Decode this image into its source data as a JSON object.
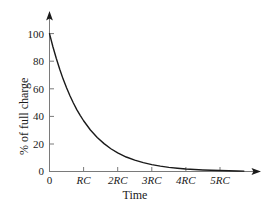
{
  "chart_data": {
    "type": "line",
    "title": "",
    "subtitle": "",
    "xlabel": "Time",
    "ylabel": "% of full charge",
    "grid": false,
    "legend": null,
    "xlim": [
      0,
      6
    ],
    "ylim": [
      0,
      105
    ],
    "xticks": [
      0,
      1,
      2,
      3,
      4,
      5
    ],
    "xtick_labels": [
      "0",
      "RC",
      "2RC",
      "3RC",
      "4RC",
      "5RC"
    ],
    "yticks": [
      0,
      20,
      40,
      60,
      80,
      100
    ],
    "ytick_labels": [
      "0",
      "20",
      "40",
      "60",
      "80",
      "100"
    ],
    "axis_arrows": {
      "x": true,
      "y": true
    },
    "curve_color": "#1a1a1a",
    "axis_color": "#6b6b6b",
    "background_color": "#ffffff",
    "annotations": [],
    "series": [
      {
        "name": "% of full charge",
        "formula": "100 * exp(-t/RC)",
        "x": [
          0,
          0.1,
          0.2,
          0.3,
          0.4,
          0.5,
          0.6,
          0.7,
          0.8,
          0.9,
          1.0,
          1.2,
          1.4,
          1.6,
          1.8,
          2.0,
          2.25,
          2.5,
          2.75,
          3.0,
          3.25,
          3.5,
          3.75,
          4.0,
          4.25,
          4.5,
          4.75,
          5.0,
          5.25,
          5.5,
          5.7
        ],
        "values": [
          100,
          90.5,
          81.9,
          74.1,
          67.0,
          60.7,
          54.9,
          49.7,
          44.9,
          40.7,
          36.8,
          30.1,
          24.7,
          20.2,
          16.5,
          13.5,
          10.5,
          8.2,
          6.4,
          5.0,
          3.9,
          3.0,
          2.4,
          1.8,
          1.4,
          1.1,
          0.9,
          0.7,
          0.5,
          0.4,
          0.3
        ]
      }
    ]
  },
  "labels": {
    "ytick_0": "0",
    "ytick_20": "20",
    "ytick_40": "40",
    "ytick_60": "60",
    "ytick_80": "80",
    "ytick_100": "100",
    "xtick_0": "0",
    "xtick_1": "RC",
    "xtick_2": "2RC",
    "xtick_3": "3RC",
    "xtick_4": "4RC",
    "xtick_5": "5RC",
    "xaxis_title": "Time",
    "yaxis_title": "% of full charge"
  }
}
